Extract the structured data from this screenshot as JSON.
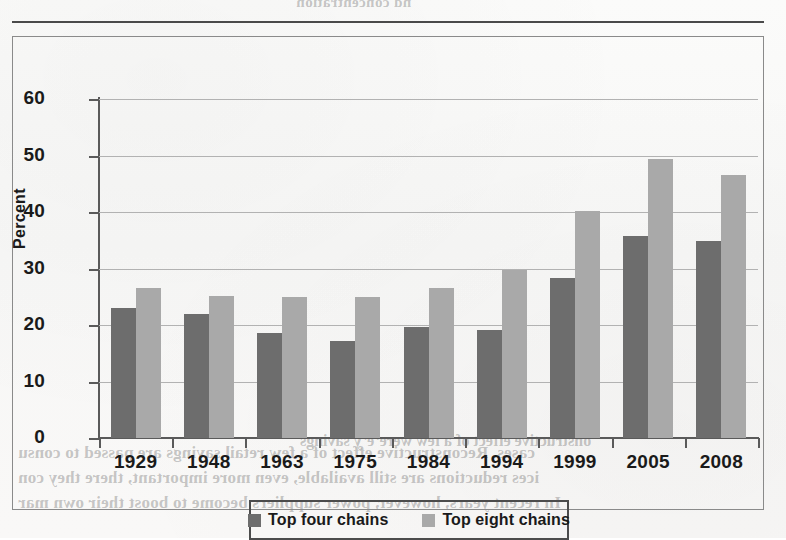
{
  "top_rule": {
    "name": "horizontal-rule"
  },
  "chart_data": {
    "type": "bar",
    "title": "",
    "subtitle": "",
    "xlabel": "",
    "ylabel": "Percent",
    "ylim": [
      0,
      60
    ],
    "yticks": [
      0,
      10,
      20,
      30,
      40,
      50,
      60
    ],
    "ytick_labels": [
      "0",
      "10",
      "20",
      "30",
      "40",
      "50",
      "60"
    ],
    "grid": "horizontal",
    "legend_position": "bottom",
    "categories": [
      "1929",
      "1948",
      "1963",
      "1975",
      "1984",
      "1994",
      "1999",
      "2005",
      "2008"
    ],
    "series": [
      {
        "name": "Top four chains",
        "color": "#6d6d6d",
        "values": [
          23.0,
          22.0,
          18.6,
          17.2,
          19.6,
          19.1,
          28.3,
          35.7,
          34.9
        ]
      },
      {
        "name": "Top eight chains",
        "color": "#a9a9a9",
        "values": [
          26.5,
          25.2,
          25.0,
          25.0,
          26.6,
          29.8,
          40.1,
          49.3,
          46.6
        ]
      }
    ]
  },
  "legend": {
    "items": [
      {
        "label": "Top four chains",
        "color": "#6d6d6d"
      },
      {
        "label": "Top eight chains",
        "color": "#a9a9a9"
      }
    ]
  },
  "bleed_through": {
    "top": "nd concentration",
    "left_1": "cases. Reconstructive effect of a few retail savings are passed to consu",
    "left_2": "ices reductions are still available, even more important, there they con",
    "left_3": "In recent years, however, power suppliers become to boost their own mar",
    "mid": "onstructive effect of a few were’e’y savings"
  }
}
